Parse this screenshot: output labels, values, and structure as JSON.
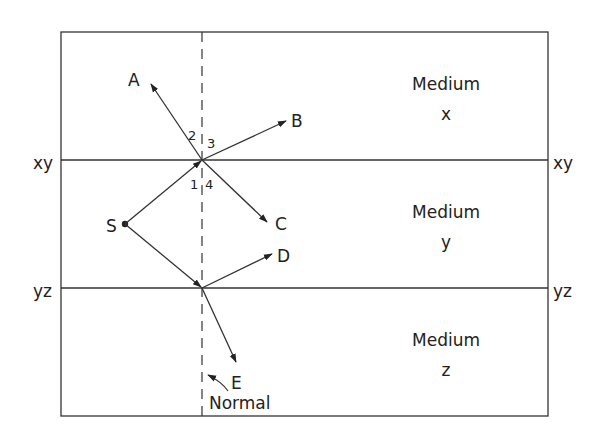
{
  "diagram": {
    "type": "refraction-reflection",
    "colors": {
      "line": "#333333",
      "text": "#222222",
      "background": "#ffffff"
    },
    "media": [
      {
        "line1": "Medium",
        "line2": "x"
      },
      {
        "line1": "Medium",
        "line2": "y"
      },
      {
        "line1": "Medium",
        "line2": "z"
      }
    ],
    "interfaces": [
      {
        "left": "xy",
        "right": "xy"
      },
      {
        "left": "yz",
        "right": "yz"
      }
    ],
    "source_label": "S",
    "rays": {
      "A": "A",
      "B": "B",
      "C": "C",
      "D": "D",
      "E": "E"
    },
    "angles": [
      "1",
      "2",
      "3",
      "4"
    ],
    "normal_label": "Normal"
  }
}
